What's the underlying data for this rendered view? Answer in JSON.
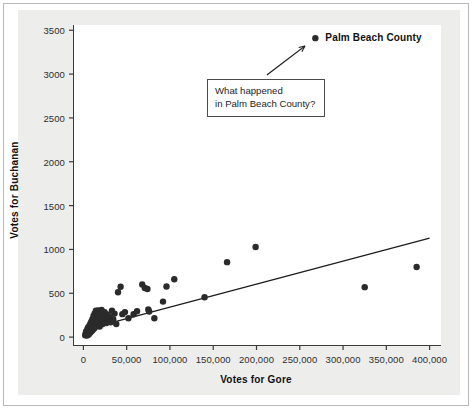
{
  "figure": {
    "background_color": "#ededeb",
    "plot_background_color": "#ffffff",
    "point_color": "#2b2b2b",
    "line_color": "#1d1d1d",
    "axis_color": "#3a3a3a"
  },
  "annotation": {
    "line1": "What happened",
    "line2": "in Palm Beach County?"
  },
  "callout": {
    "label": "Palm Beach County"
  },
  "chart_data": {
    "type": "scatter",
    "title": "",
    "xlabel": "Votes for Gore",
    "ylabel": "Votes for Buchanan",
    "xlim": [
      -12000,
      412000
    ],
    "ylim": [
      -90,
      3560
    ],
    "xticks": [
      0,
      50000,
      100000,
      150000,
      200000,
      250000,
      300000,
      350000,
      400000
    ],
    "xtick_labels": [
      "0",
      "50,000",
      "100,000",
      "150,000",
      "200,000",
      "250,000",
      "300,000",
      "350,000",
      "400,000"
    ],
    "yticks": [
      0,
      500,
      1000,
      1500,
      2000,
      2500,
      3000,
      3500
    ],
    "ytick_labels": [
      "0",
      "500",
      "1000",
      "1500",
      "2000",
      "2500",
      "3000",
      "3500"
    ],
    "grid": false,
    "legend": null,
    "marker_size": 5.2,
    "trendline": {
      "type": "linear-fit",
      "x_start": 0,
      "y_start": 80,
      "x_end": 400000,
      "y_end": 1130
    },
    "highlight_point": {
      "label": "Palm Beach County",
      "x": 268000,
      "y": 3410
    },
    "annotation_arrow": {
      "from_x": 212000,
      "from_y": 2990,
      "to_x": 256000,
      "to_y": 3320
    },
    "points": [
      {
        "x": 2100,
        "y": 20
      },
      {
        "x": 2600,
        "y": 35
      },
      {
        "x": 3000,
        "y": 55
      },
      {
        "x": 3400,
        "y": 28
      },
      {
        "x": 3900,
        "y": 70
      },
      {
        "x": 4200,
        "y": 18
      },
      {
        "x": 4600,
        "y": 90
      },
      {
        "x": 5000,
        "y": 45
      },
      {
        "x": 5400,
        "y": 110
      },
      {
        "x": 5800,
        "y": 62
      },
      {
        "x": 6200,
        "y": 30
      },
      {
        "x": 6600,
        "y": 125
      },
      {
        "x": 7000,
        "y": 80
      },
      {
        "x": 7400,
        "y": 48
      },
      {
        "x": 7900,
        "y": 150
      },
      {
        "x": 8300,
        "y": 95
      },
      {
        "x": 8700,
        "y": 60
      },
      {
        "x": 9100,
        "y": 175
      },
      {
        "x": 9500,
        "y": 112
      },
      {
        "x": 9900,
        "y": 72
      },
      {
        "x": 10400,
        "y": 205
      },
      {
        "x": 10800,
        "y": 130
      },
      {
        "x": 11200,
        "y": 88
      },
      {
        "x": 11700,
        "y": 240
      },
      {
        "x": 12100,
        "y": 155
      },
      {
        "x": 12600,
        "y": 100
      },
      {
        "x": 13000,
        "y": 270
      },
      {
        "x": 13500,
        "y": 178
      },
      {
        "x": 14000,
        "y": 118
      },
      {
        "x": 14500,
        "y": 300
      },
      {
        "x": 15000,
        "y": 198
      },
      {
        "x": 15500,
        "y": 135
      },
      {
        "x": 16000,
        "y": 218
      },
      {
        "x": 16500,
        "y": 158
      },
      {
        "x": 17000,
        "y": 305
      },
      {
        "x": 17600,
        "y": 240
      },
      {
        "x": 18200,
        "y": 172
      },
      {
        "x": 18800,
        "y": 120
      },
      {
        "x": 19500,
        "y": 262
      },
      {
        "x": 20200,
        "y": 195
      },
      {
        "x": 21000,
        "y": 310
      },
      {
        "x": 21800,
        "y": 148
      },
      {
        "x": 22600,
        "y": 225
      },
      {
        "x": 23500,
        "y": 178
      },
      {
        "x": 24500,
        "y": 285
      },
      {
        "x": 25500,
        "y": 205
      },
      {
        "x": 26500,
        "y": 160
      },
      {
        "x": 27500,
        "y": 258
      },
      {
        "x": 28500,
        "y": 198
      },
      {
        "x": 30000,
        "y": 232
      },
      {
        "x": 31500,
        "y": 170
      },
      {
        "x": 33000,
        "y": 300
      },
      {
        "x": 34500,
        "y": 205
      },
      {
        "x": 36000,
        "y": 268
      },
      {
        "x": 38000,
        "y": 150
      },
      {
        "x": 40000,
        "y": 512
      },
      {
        "x": 43000,
        "y": 575
      },
      {
        "x": 45000,
        "y": 262
      },
      {
        "x": 48000,
        "y": 285
      },
      {
        "x": 52000,
        "y": 215
      },
      {
        "x": 58000,
        "y": 260
      },
      {
        "x": 62000,
        "y": 295
      },
      {
        "x": 68000,
        "y": 600
      },
      {
        "x": 71000,
        "y": 560
      },
      {
        "x": 74000,
        "y": 548
      },
      {
        "x": 75000,
        "y": 315
      },
      {
        "x": 76000,
        "y": 292
      },
      {
        "x": 82000,
        "y": 215
      },
      {
        "x": 92000,
        "y": 405
      },
      {
        "x": 96000,
        "y": 578
      },
      {
        "x": 105000,
        "y": 660
      },
      {
        "x": 140000,
        "y": 455
      },
      {
        "x": 166000,
        "y": 855
      },
      {
        "x": 199000,
        "y": 1028
      },
      {
        "x": 325000,
        "y": 570
      },
      {
        "x": 385000,
        "y": 800
      },
      {
        "x": 268000,
        "y": 3410
      }
    ]
  }
}
